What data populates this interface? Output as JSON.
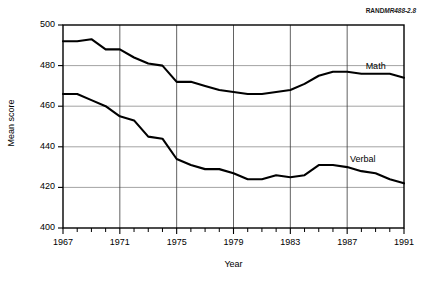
{
  "figure": {
    "rand_id_prefix": "RAND",
    "rand_id_suffix": "MR488-2.8"
  },
  "chart_data": {
    "type": "line",
    "title": "",
    "xlabel": "Year",
    "ylabel": "Mean score",
    "xlim": [
      1967,
      1991
    ],
    "ylim": [
      400,
      500
    ],
    "grid": true,
    "legend_position": "inline-right",
    "x_tick_labels": [
      "1967",
      "1971",
      "1975",
      "1979",
      "1983",
      "1987",
      "1991"
    ],
    "x_tick_values": [
      1967,
      1971,
      1975,
      1979,
      1983,
      1987,
      1991
    ],
    "x_minor_ticks": [
      1968,
      1969,
      1970,
      1972,
      1973,
      1974,
      1976,
      1977,
      1978,
      1980,
      1981,
      1982,
      1984,
      1985,
      1986,
      1988,
      1989,
      1990
    ],
    "y_tick_labels": [
      "400",
      "420",
      "440",
      "460",
      "480",
      "500"
    ],
    "y_tick_values": [
      400,
      420,
      440,
      460,
      480,
      500
    ],
    "x": [
      1967,
      1968,
      1969,
      1970,
      1971,
      1972,
      1973,
      1974,
      1975,
      1976,
      1977,
      1978,
      1979,
      1980,
      1981,
      1982,
      1983,
      1984,
      1985,
      1986,
      1987,
      1988,
      1989,
      1990,
      1991
    ],
    "series": [
      {
        "name": "Math",
        "label": "Math",
        "color": "#000000",
        "values": [
          492,
          492,
          493,
          488,
          488,
          484,
          481,
          480,
          472,
          472,
          470,
          468,
          467,
          466,
          466,
          467,
          468,
          471,
          475,
          477,
          477,
          476,
          476,
          476,
          474
        ]
      },
      {
        "name": "Verbal",
        "label": "Verbal",
        "color": "#000000",
        "values": [
          466,
          466,
          463,
          460,
          455,
          453,
          445,
          444,
          434,
          431,
          429,
          429,
          427,
          424,
          424,
          426,
          425,
          426,
          431,
          431,
          430,
          428,
          427,
          424,
          422
        ]
      }
    ]
  }
}
